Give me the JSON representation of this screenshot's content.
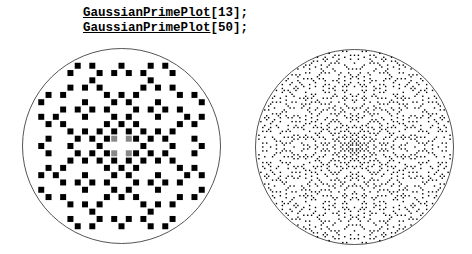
{
  "notebook": {
    "input_lines": [
      {
        "function": "GaussianPrimePlot",
        "args": "[13];"
      },
      {
        "function": "GaussianPrimePlot",
        "args": "[50];"
      }
    ]
  },
  "plots": [
    {
      "name": "gaussian-prime-plot-13",
      "radius": 13,
      "point_color": "#000000",
      "boundary_color": "#555555"
    },
    {
      "name": "gaussian-prime-plot-50",
      "radius": 50,
      "point_color": "#000000",
      "boundary_color": "#555555"
    }
  ]
}
